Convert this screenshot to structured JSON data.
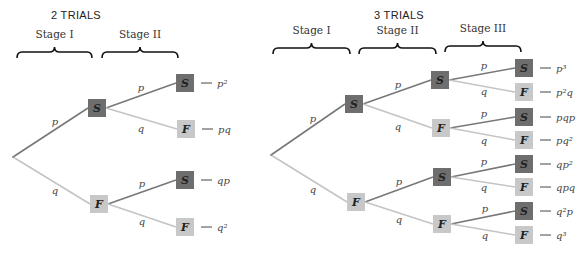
{
  "colors": {
    "success_node": "#6e6e6e",
    "failure_node": "#c8c8c8",
    "edge_p": "#787878",
    "edge_q": "#c4c4c4"
  },
  "diagrams": [
    {
      "id": "two-trials",
      "title": "2 TRIALS",
      "title_pos": [
        76,
        19
      ],
      "stages": [
        {
          "label": "Stage I",
          "x1": 17,
          "x2": 92,
          "label_y": 38,
          "brace_y": 50
        },
        {
          "label": "Stage II",
          "x1": 102,
          "x2": 178,
          "label_y": 38,
          "brace_y": 50
        }
      ],
      "root": [
        13,
        157
      ],
      "nodes": [
        {
          "id": "a1",
          "type": "S",
          "x": 97,
          "y": 108,
          "parent": "root",
          "edge": "p",
          "label_pos": [
            55,
            125
          ]
        },
        {
          "id": "a2",
          "type": "F",
          "x": 99,
          "y": 204,
          "parent": "root",
          "edge": "q",
          "label_pos": [
            55,
            194
          ]
        },
        {
          "id": "b1",
          "type": "S",
          "x": 185,
          "y": 83,
          "parent": "a1",
          "edge": "p",
          "label_pos": [
            141,
            91
          ],
          "outcome": "p²"
        },
        {
          "id": "b2",
          "type": "F",
          "x": 186,
          "y": 129,
          "parent": "a1",
          "edge": "q",
          "label_pos": [
            141,
            132
          ],
          "outcome": "pq"
        },
        {
          "id": "b3",
          "type": "S",
          "x": 185,
          "y": 180,
          "parent": "a2",
          "edge": "p",
          "label_pos": [
            142,
            187
          ],
          "outcome": "qp"
        },
        {
          "id": "b4",
          "type": "F",
          "x": 185,
          "y": 227,
          "parent": "a2",
          "edge": "q",
          "label_pos": [
            142,
            225
          ],
          "outcome": "q²"
        }
      ]
    },
    {
      "id": "three-trials",
      "title": "3 TRIALS",
      "title_pos": [
        399,
        19
      ],
      "stages": [
        {
          "label": "Stage I",
          "x1": 273,
          "x2": 350,
          "label_y": 34,
          "brace_y": 46
        },
        {
          "label": "Stage II",
          "x1": 359,
          "x2": 436,
          "label_y": 34,
          "brace_y": 46
        },
        {
          "label": "Stage III",
          "x1": 445,
          "x2": 521,
          "label_y": 32,
          "brace_y": 44
        }
      ],
      "root": [
        271,
        155
      ],
      "nodes": [
        {
          "id": "a1",
          "type": "S",
          "x": 354,
          "y": 104,
          "parent": "root",
          "edge": "p",
          "label_pos": [
            313,
            122
          ]
        },
        {
          "id": "a2",
          "type": "F",
          "x": 356,
          "y": 202,
          "parent": "root",
          "edge": "q",
          "label_pos": [
            313,
            193
          ]
        },
        {
          "id": "b1",
          "type": "S",
          "x": 440,
          "y": 80,
          "parent": "a1",
          "edge": "p",
          "label_pos": [
            398,
            88
          ]
        },
        {
          "id": "b2",
          "type": "F",
          "x": 441,
          "y": 128,
          "parent": "a1",
          "edge": "q",
          "label_pos": [
            398,
            130
          ]
        },
        {
          "id": "b3",
          "type": "S",
          "x": 442,
          "y": 177,
          "parent": "a2",
          "edge": "p",
          "label_pos": [
            399,
            185
          ]
        },
        {
          "id": "b4",
          "type": "F",
          "x": 442,
          "y": 224,
          "parent": "a2",
          "edge": "q",
          "label_pos": [
            399,
            223
          ]
        },
        {
          "id": "c1",
          "type": "S",
          "x": 524,
          "y": 68,
          "parent": "b1",
          "edge": "p",
          "label_pos": [
            484,
            69
          ],
          "outcome": "p³"
        },
        {
          "id": "c2",
          "type": "F",
          "x": 524,
          "y": 92,
          "parent": "b1",
          "edge": "q",
          "label_pos": [
            484,
            95
          ],
          "outcome": "p²q"
        },
        {
          "id": "c3",
          "type": "S",
          "x": 524,
          "y": 117,
          "parent": "b2",
          "edge": "p",
          "label_pos": [
            484,
            117
          ],
          "outcome": "pqp"
        },
        {
          "id": "c4",
          "type": "F",
          "x": 524,
          "y": 140,
          "parent": "b2",
          "edge": "q",
          "label_pos": [
            484,
            144
          ],
          "outcome": "pq²"
        },
        {
          "id": "c5",
          "type": "S",
          "x": 524,
          "y": 164,
          "parent": "b3",
          "edge": "p",
          "label_pos": [
            484,
            165
          ],
          "outcome": "qp²"
        },
        {
          "id": "c6",
          "type": "F",
          "x": 524,
          "y": 187,
          "parent": "b3",
          "edge": "q",
          "label_pos": [
            484,
            191
          ],
          "outcome": "qpq"
        },
        {
          "id": "c7",
          "type": "S",
          "x": 524,
          "y": 211,
          "parent": "b4",
          "edge": "p",
          "label_pos": [
            485,
            212
          ],
          "outcome": "q²p"
        },
        {
          "id": "c8",
          "type": "F",
          "x": 524,
          "y": 235,
          "parent": "b4",
          "edge": "q",
          "label_pos": [
            485,
            239
          ],
          "outcome": "q³"
        }
      ]
    }
  ]
}
